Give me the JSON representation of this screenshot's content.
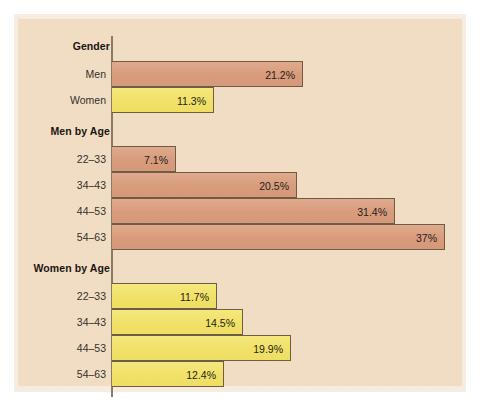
{
  "chart_data": {
    "type": "bar",
    "orientation": "horizontal",
    "title": "",
    "subtitle": "",
    "xlabel": "",
    "ylabel": "",
    "grid": false,
    "legend": "none",
    "axis_origin_percent": 0,
    "xlim": [
      0,
      39
    ],
    "value_suffix": "%",
    "colors": {
      "men": "#dca284",
      "women": "#f3e471",
      "bar_outline": "#6d5c46",
      "axis": "#8a7a63",
      "panel_background": "#f1ddc3",
      "page_background": "#ffffff",
      "label_text": "#35302a",
      "group_title_text": "#1a1512"
    },
    "groups": [
      {
        "title": "Gender",
        "rows": [
          {
            "label": "Men",
            "value": 21.2,
            "value_label": "21.2%",
            "series": "men"
          },
          {
            "label": "Women",
            "value": 11.3,
            "value_label": "11.3%",
            "series": "women"
          }
        ]
      },
      {
        "title": "Men by Age",
        "rows": [
          {
            "label": "22–33",
            "value": 7.1,
            "value_label": "7.1%",
            "series": "men"
          },
          {
            "label": "34–43",
            "value": 20.5,
            "value_label": "20.5%",
            "series": "men"
          },
          {
            "label": "44–53",
            "value": 31.4,
            "value_label": "31.4%",
            "series": "men"
          },
          {
            "label": "54–63",
            "value": 37.0,
            "value_label": "37%",
            "series": "men"
          }
        ]
      },
      {
        "title": "Women by Age",
        "rows": [
          {
            "label": "22–33",
            "value": 11.7,
            "value_label": "11.7%",
            "series": "women"
          },
          {
            "label": "34–43",
            "value": 14.5,
            "value_label": "14.5%",
            "series": "women"
          },
          {
            "label": "44–53",
            "value": 19.9,
            "value_label": "19.9%",
            "series": "women"
          },
          {
            "label": "54–63",
            "value": 12.4,
            "value_label": "12.4%",
            "series": "women"
          }
        ]
      }
    ]
  }
}
